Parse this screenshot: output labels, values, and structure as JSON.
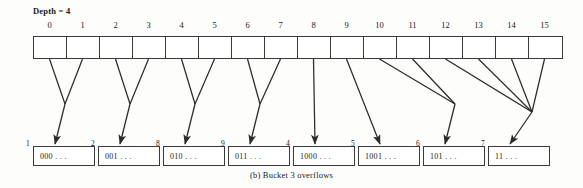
{
  "figure": {
    "depth_label": "Depth = 4",
    "caption": "(b)  Bucket 3 overflows"
  },
  "directory": {
    "indices": [
      "0",
      "1",
      "2",
      "3",
      "4",
      "5",
      "6",
      "7",
      "8",
      "9",
      "10",
      "11",
      "12",
      "13",
      "14",
      "15"
    ],
    "cell_count": 16
  },
  "buckets": [
    {
      "num": "1",
      "content": "000 . . ."
    },
    {
      "num": "2",
      "content": "001 . . ."
    },
    {
      "num": "8",
      "content": "010 . . ."
    },
    {
      "num": "9",
      "content": "011 . . ."
    },
    {
      "num": "4",
      "content": "1000 . . ."
    },
    {
      "num": "5",
      "content": "1001 . . ."
    },
    {
      "num": "6",
      "content": "101 . . ."
    },
    {
      "num": "7",
      "content": "11 . . ."
    }
  ],
  "colors": {
    "line": "#2b2b2b",
    "box_border": "#3a3a3a",
    "background": "#fdfdfc",
    "text": "#1a1a1a"
  }
}
